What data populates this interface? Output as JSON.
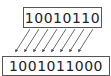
{
  "diagram": {
    "operation": "left shift by 2",
    "input_bits": "10010110",
    "output_bits": "1001011000",
    "arrow_count": 8,
    "colors": {
      "border": "#555555",
      "text": "#222222",
      "arrow": "#444444"
    }
  }
}
